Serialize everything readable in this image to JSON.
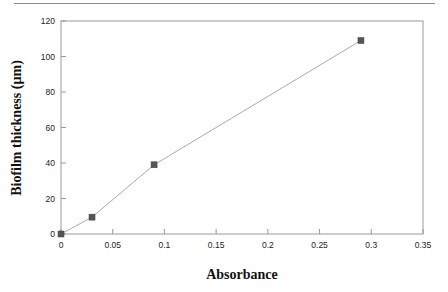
{
  "chart_data": {
    "type": "line",
    "title": "",
    "xlabel": "Absorbance",
    "ylabel": "Biofilm thickness (µm)",
    "xlim": [
      0,
      0.35
    ],
    "ylim": [
      0,
      120
    ],
    "xticks": [
      "0",
      "0.05",
      "0.1",
      "0.15",
      "0.2",
      "0.25",
      "0.3",
      "0.35"
    ],
    "yticks": [
      "0",
      "20",
      "40",
      "60",
      "80",
      "100",
      "120"
    ],
    "grid": false,
    "legend": null,
    "marker": "square",
    "series": [
      {
        "name": "Biofilm thickness",
        "x": [
          0,
          0.03,
          0.09,
          0.29
        ],
        "y": [
          0,
          9.5,
          39,
          109
        ],
        "color": "#555555"
      }
    ]
  },
  "colors": {
    "axis": "#999999",
    "line": "#aaaaaa",
    "marker": "#555555"
  }
}
